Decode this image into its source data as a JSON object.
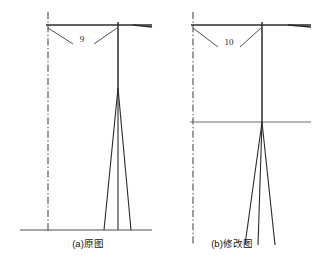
{
  "figure": {
    "background_color": "#ffffff",
    "line_color": "#2b2b2b",
    "centerline_color": "#4a4a4a",
    "text_color": "#1a1a1a",
    "width": 320,
    "height": 268
  },
  "panels": [
    {
      "id": "panel-a",
      "caption": "(a)原图",
      "caption_x": 88,
      "caption_y": 247,
      "dimension_label": "9",
      "dimension_label_x": 82,
      "dimension_label_y": 42,
      "centerline": {
        "x": 48,
        "y1": 12,
        "y2": 232
      },
      "crossarm": {
        "x1": 46,
        "x2": 152,
        "y": 25
      },
      "crossarm_tip": {
        "x1": 133,
        "x2": 152,
        "y1": 25,
        "y2": 27
      },
      "mast": {
        "x": 118,
        "y_top": 22,
        "y_split": 88
      },
      "ground": {
        "x1": 20,
        "x2": 152,
        "y": 230
      },
      "legs": [
        {
          "x_top": 118,
          "y_top": 88,
          "x_bottom": 104,
          "y_bottom": 230
        },
        {
          "x_top": 118,
          "y_top": 88,
          "x_bottom": 118,
          "y_bottom": 230
        },
        {
          "x_top": 118,
          "y_top": 88,
          "x_bottom": 131,
          "y_bottom": 230
        }
      ],
      "leaders": [
        {
          "x1": 48,
          "y1": 28,
          "x2": 73,
          "y2": 44
        },
        {
          "x1": 94,
          "y1": 44,
          "x2": 117,
          "y2": 28
        }
      ],
      "waterline": null
    },
    {
      "id": "panel-b",
      "caption": "(b)修改图",
      "caption_x": 232,
      "caption_y": 247,
      "dimension_label": "10",
      "dimension_label_x": 229,
      "dimension_label_y": 45,
      "centerline": {
        "x": 193,
        "y1": 12,
        "y2": 245
      },
      "crossarm": {
        "x1": 191,
        "x2": 311,
        "y": 25
      },
      "crossarm_tip": {
        "x1": 288,
        "x2": 311,
        "y1": 25,
        "y2": 27
      },
      "mast": {
        "x": 262,
        "y_top": 22,
        "y_split": 122
      },
      "ground": null,
      "legs": [
        {
          "x_top": 262,
          "y_top": 122,
          "x_bottom": 245,
          "y_bottom": 245
        },
        {
          "x_top": 262,
          "y_top": 122,
          "x_bottom": 258,
          "y_bottom": 245
        },
        {
          "x_top": 262,
          "y_top": 122,
          "x_bottom": 275,
          "y_bottom": 245
        }
      ],
      "leaders": [
        {
          "x1": 193,
          "y1": 28,
          "x2": 218,
          "y2": 47
        },
        {
          "x1": 240,
          "y1": 47,
          "x2": 261,
          "y2": 28
        }
      ],
      "waterline": {
        "x1": 190,
        "x2": 311,
        "y": 122
      }
    }
  ]
}
